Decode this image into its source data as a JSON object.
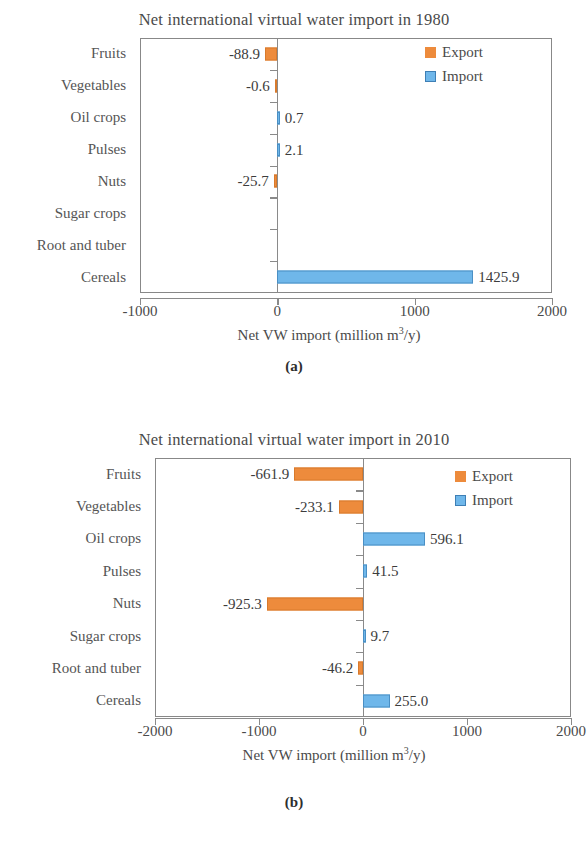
{
  "chart_data": [
    {
      "type": "bar",
      "orientation": "horizontal",
      "title": "Net international  virtual water import in 1980",
      "panel_caption": "(a)",
      "xlabel_prefix": "Net VW import  (million  m",
      "xlabel_sup": "3",
      "xlabel_suffix": "/y)",
      "ylabel": "",
      "categories": [
        "Fruits",
        "Vegetables",
        "Oil crops",
        "Pulses",
        "Nuts",
        "Sugar crops",
        "Root and tuber",
        "Cereals"
      ],
      "values": [
        -88.9,
        -0.6,
        0.7,
        2.1,
        -25.7,
        null,
        null,
        1425.9
      ],
      "value_labels": [
        "-88.9",
        "-0.6",
        "0.7",
        "2.1",
        "-25.7",
        "",
        "",
        "1425.9"
      ],
      "xlim": [
        -1000,
        2000
      ],
      "xticks": [
        -1000,
        0,
        1000,
        2000
      ],
      "xticklabels": [
        "-1000",
        "0",
        "1000",
        "2000"
      ],
      "grid": false,
      "legend": {
        "position": "top-right",
        "entries": [
          {
            "label": "Export",
            "color": "#ED8B3C"
          },
          {
            "label": "Import",
            "color": "#6FB7EA"
          }
        ]
      }
    },
    {
      "type": "bar",
      "orientation": "horizontal",
      "title": "Net international  virtual water import in 2010",
      "panel_caption": "(b)",
      "xlabel_prefix": "Net VW import  (million  m",
      "xlabel_sup": "3",
      "xlabel_suffix": "/y)",
      "ylabel": "",
      "categories": [
        "Fruits",
        "Vegetables",
        "Oil crops",
        "Pulses",
        "Nuts",
        "Sugar crops",
        "Root and tuber",
        "Cereals"
      ],
      "values": [
        -661.9,
        -233.1,
        596.1,
        41.5,
        -925.3,
        9.7,
        -46.2,
        255.0
      ],
      "value_labels": [
        "-661.9",
        "-233.1",
        "596.1",
        "41.5",
        "-925.3",
        "9.7",
        "-46.2",
        "255.0"
      ],
      "xlim": [
        -2000,
        2000
      ],
      "xticks": [
        -2000,
        -1000,
        0,
        1000,
        2000
      ],
      "xticklabels": [
        "-2000",
        "-1000",
        "0",
        "1000",
        "2000"
      ],
      "grid": false,
      "legend": {
        "position": "top-right",
        "entries": [
          {
            "label": "Export",
            "color": "#ED8B3C"
          },
          {
            "label": "Import",
            "color": "#6FB7EA"
          }
        ]
      }
    }
  ],
  "colors": {
    "export": "#ED8B3C",
    "import": "#6FB7EA",
    "axis": "#8a8a8a",
    "text": "#4a4a4a"
  }
}
